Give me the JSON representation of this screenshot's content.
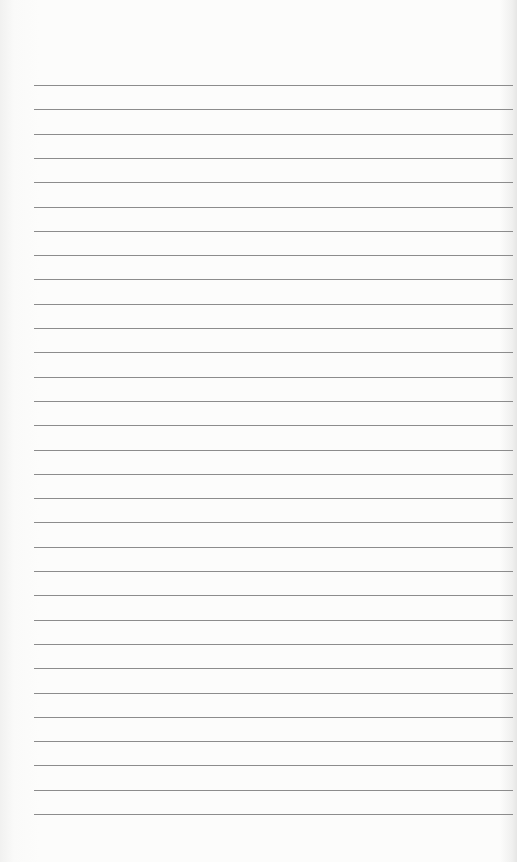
{
  "page": {
    "type": "lined-paper",
    "line_count": 31,
    "first_line_y": 85,
    "line_spacing": 24.3,
    "line_left": 34,
    "line_right": 513,
    "line_color": "#8c8c8c",
    "paper_color": "#fbfbfa"
  }
}
